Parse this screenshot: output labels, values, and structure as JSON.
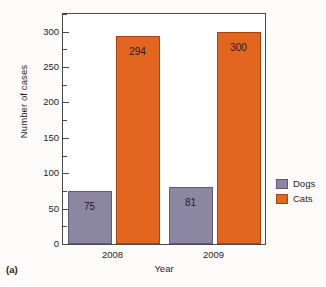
{
  "caption": "(a)",
  "legend": {
    "position": "right",
    "entries": [
      {
        "label": "Dogs",
        "color": "#8b87a3",
        "swatch": "dogs-swatch-icon"
      },
      {
        "label": "Cats",
        "color": "#e2661f",
        "swatch": "cats-swatch-icon"
      }
    ]
  },
  "axes": {
    "ylabel": "Number of cases",
    "xlabel": "Year",
    "ytick_labels": [
      "0",
      "50",
      "100",
      "150",
      "200",
      "250",
      "300"
    ],
    "xtick_labels": [
      "2008",
      "2009"
    ]
  },
  "chart_data": {
    "type": "bar",
    "title": "",
    "subtitle": "",
    "categories": [
      "2008",
      "2009"
    ],
    "series": [
      {
        "name": "Dogs",
        "values": [
          75,
          81
        ],
        "color": "#8b87a3"
      },
      {
        "name": "Cats",
        "values": [
          294,
          300
        ],
        "color": "#e2661f"
      }
    ],
    "xlabel": "Year",
    "ylabel": "Number of cases",
    "ylim": [
      0,
      325
    ],
    "ytick_major_step": 50,
    "ytick_minor_step": 25,
    "ytick_values": [
      0,
      50,
      100,
      150,
      200,
      250,
      300
    ],
    "data_labels": [
      "75",
      "294",
      "81",
      "300"
    ],
    "grid": false,
    "legend_position": "right",
    "figure_caption": "(a)"
  }
}
